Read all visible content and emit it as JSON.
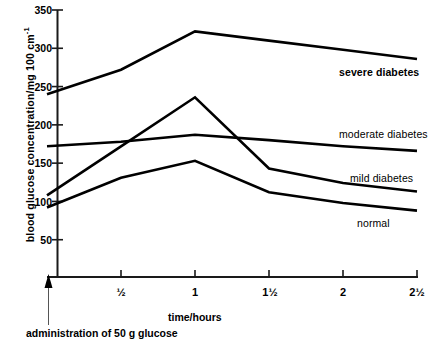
{
  "chart_data": {
    "type": "line",
    "title": "",
    "xlabel": "time/hours",
    "ylabel": "blood glucose concentration/mg 100 cm",
    "ylabel_exponent": "-1",
    "caption": "administration of 50 g glucose",
    "grid": false,
    "legend_position": "inline-right",
    "x": [
      0,
      0.5,
      1,
      1.5,
      2,
      2.5
    ],
    "xtick_labels": [
      "½",
      "1",
      "1½",
      "2",
      "2½"
    ],
    "xtick_values": [
      0.5,
      1,
      1.5,
      2,
      2.5
    ],
    "xlim": [
      0,
      2.5
    ],
    "ytick_labels": [
      "350",
      "300",
      "250",
      "200",
      "150",
      "100",
      "50"
    ],
    "ytick_values": [
      350,
      300,
      250,
      200,
      150,
      100,
      50
    ],
    "ylim": [
      0,
      350
    ],
    "series": [
      {
        "name": "severe diabetes",
        "label": "severe diabetes",
        "bold": true,
        "values": [
          240,
          272,
          322,
          310,
          298,
          286
        ]
      },
      {
        "name": "mild diabetes",
        "label": "mild diabetes",
        "bold": false,
        "values": [
          108,
          172,
          236,
          143,
          124,
          113
        ]
      },
      {
        "name": "moderate diabetes",
        "label": "moderate diabetes",
        "bold": false,
        "values": [
          172,
          178,
          187,
          180,
          172,
          166
        ]
      },
      {
        "name": "normal",
        "label": "normal",
        "bold": false,
        "values": [
          92,
          131,
          153,
          112,
          98,
          88
        ]
      }
    ],
    "colors": {
      "line": "#000000",
      "axis": "#1a1a1a",
      "background": "#ffffff"
    }
  },
  "axis": {
    "ytick_0": "350",
    "ytick_1": "300",
    "ytick_2": "250",
    "ytick_3": "200",
    "ytick_4": "150",
    "ytick_5": "100",
    "ytick_6": "50",
    "xtick_0": "½",
    "xtick_1": "1",
    "xtick_2": "1½",
    "xtick_3": "2",
    "xtick_4": "2½"
  },
  "labels": {
    "y_axis_title": "blood glucose concentration/mg 100 cm",
    "y_axis_exponent": "-1",
    "x_axis_title": "time/hours",
    "arrow_caption": "administration of 50 g glucose",
    "series_severe": "severe diabetes",
    "series_moderate": "moderate diabetes",
    "series_mild": "mild diabetes",
    "series_normal": "normal"
  }
}
